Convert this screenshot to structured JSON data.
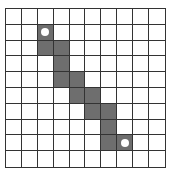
{
  "grid": {
    "rows": 10,
    "cols": 10,
    "line_color": "#333333",
    "shade_color": "#6e6e6e",
    "shaded_cells": [
      [
        1,
        2
      ],
      [
        2,
        2
      ],
      [
        2,
        3
      ],
      [
        3,
        3
      ],
      [
        4,
        3
      ],
      [
        4,
        4
      ],
      [
        5,
        4
      ],
      [
        5,
        5
      ],
      [
        6,
        5
      ],
      [
        6,
        6
      ],
      [
        7,
        6
      ],
      [
        8,
        6
      ],
      [
        8,
        7
      ]
    ],
    "markers": [
      {
        "name": "start-marker",
        "row": 1,
        "col": 2
      },
      {
        "name": "end-marker",
        "row": 8,
        "col": 7
      }
    ]
  }
}
